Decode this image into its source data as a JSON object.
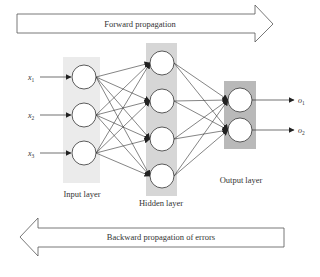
{
  "diagram": {
    "forward_arrow": {
      "label": "Forward propagation"
    },
    "backward_arrow": {
      "label": "Backward propagation of errors"
    },
    "layers": {
      "input": {
        "label": "Input layer",
        "nodes": 3,
        "fill": "#ebebeb"
      },
      "hidden": {
        "label": "Hidden layer",
        "nodes": 4,
        "fill": "#d6d6d6"
      },
      "output": {
        "label": "Output layer",
        "nodes": 2,
        "fill": "#b9b9b9"
      }
    },
    "inputs": [
      {
        "symbol": "x",
        "sub": "1"
      },
      {
        "symbol": "x",
        "sub": "2"
      },
      {
        "symbol": "x",
        "sub": "3"
      }
    ],
    "outputs": [
      {
        "symbol": "o",
        "sub": "1"
      },
      {
        "symbol": "o",
        "sub": "2"
      }
    ],
    "connections": "fully connected between adjacent layers"
  }
}
